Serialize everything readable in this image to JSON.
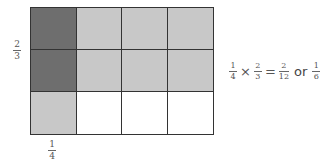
{
  "colors": {
    "overlap": "#6e6e6e",
    "shaded": "#c8c8c8",
    "empty": "#ffffff",
    "grid_line": "#333333"
  },
  "grid": {
    "rows": 3,
    "cols": 4,
    "cells": [
      [
        "overlap",
        "shaded",
        "shaded",
        "shaded"
      ],
      [
        "overlap",
        "shaded",
        "shaded",
        "shaded"
      ],
      [
        "shaded",
        "empty",
        "empty",
        "empty"
      ]
    ]
  },
  "labels": {
    "row_fraction": {
      "num": "2",
      "den": "3"
    },
    "col_fraction": {
      "num": "1",
      "den": "4"
    }
  },
  "equation": {
    "a": {
      "num": "1",
      "den": "4"
    },
    "times": "×",
    "b": {
      "num": "2",
      "den": "3"
    },
    "equals": "=",
    "result": {
      "num": "2",
      "den": "12"
    },
    "or": "or",
    "simplified": {
      "num": "1",
      "den": "6"
    }
  }
}
